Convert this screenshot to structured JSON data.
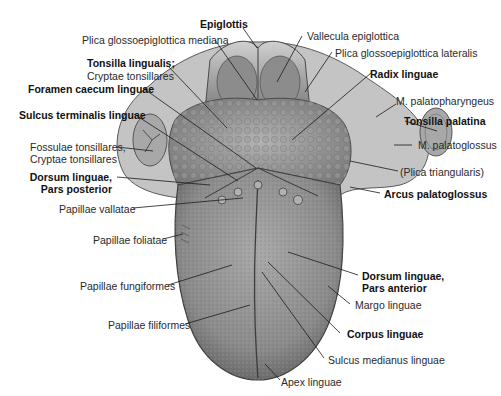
{
  "figure": {
    "colors": {
      "background": "#ffffff",
      "tissue_light": "#b9b9b9",
      "tissue_mid": "#8f8f8f",
      "tissue_dark": "#5e5e5e",
      "leader_line": "#1a1a1a",
      "label_text": "#2a2a2a"
    },
    "labels": {
      "epiglottis": "Epiglottis",
      "plica_mediana": "Plica glossoepiglottica mediana",
      "tonsilla_lingualis_1": "Tonsilla lingualis;",
      "tonsilla_lingualis_2": "Cryptae tonsillares",
      "foramen_caecum": "Foramen caecum linguae",
      "sulcus_terminalis": "Sulcus terminalis linguae",
      "fossulae_1": "Fossulae tonsillares,",
      "fossulae_2": "Cryptae tonsillares",
      "dorsum_posterior_1": "Dorsum linguae,",
      "dorsum_posterior_2": "Pars posterior",
      "papillae_vallatae": "Papillae vallatae",
      "papillae_foliatae": "Papillae foliatae",
      "papillae_fungiformes": "Papillae fungiformes",
      "papillae_filiformes": "Papillae filiformes",
      "vallecula": "Vallecula epiglottica",
      "plica_lateralis": "Plica glossoepiglottica lateralis",
      "radix": "Radix linguae",
      "m_palatopharyngeus": "M. palatopharyngeus",
      "tonsilla_palatina": "Tonsilla palatina",
      "m_palatoglossus": "M. palatoglossus",
      "plica_triangularis": "(Plica triangularis)",
      "arcus_palatoglossus": "Arcus palatoglossus",
      "dorsum_anterior_1": "Dorsum linguae,",
      "dorsum_anterior_2": "Pars anterior",
      "margo": "Margo linguae",
      "corpus": "Corpus linguae",
      "sulcus_medianus": "Sulcus medianus linguae",
      "apex": "Apex linguae"
    }
  }
}
